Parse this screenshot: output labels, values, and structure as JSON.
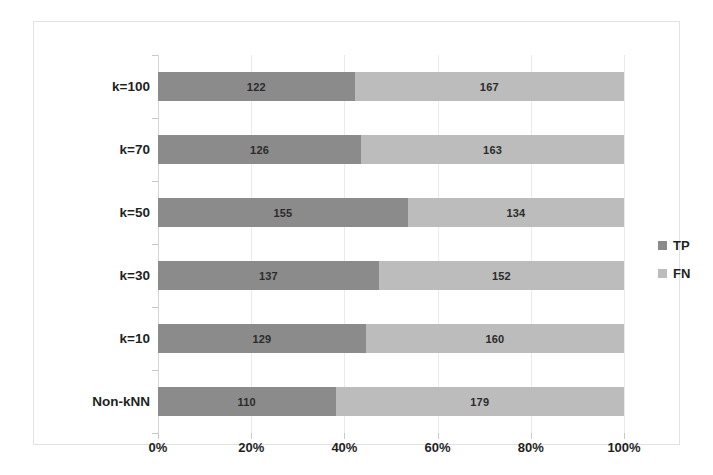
{
  "chart_data": {
    "type": "bar",
    "orientation": "horizontal",
    "stacked": true,
    "normalized": "100%",
    "title": "",
    "xlabel": "",
    "ylabel": "",
    "xlim": [
      0,
      100
    ],
    "grid": true,
    "legend_position": "right",
    "categories": [
      "Non-kNN",
      "k=10",
      "k=30",
      "k=50",
      "k=70",
      "k=100"
    ],
    "series": [
      {
        "name": "TP",
        "color": "#8b8b8b",
        "values": [
          110,
          129,
          137,
          155,
          126,
          122
        ]
      },
      {
        "name": "FN",
        "color": "#bcbcbc",
        "values": [
          179,
          160,
          152,
          134,
          163,
          167
        ]
      }
    ],
    "x_tick_labels": [
      "0%",
      "20%",
      "40%",
      "60%",
      "80%",
      "100%"
    ],
    "x_tick_values": [
      0,
      20,
      40,
      60,
      80,
      100
    ],
    "rows": [
      {
        "category": "k=100",
        "tp": 122,
        "fn": 167,
        "tp_pct": 42.2,
        "fn_pct": 57.8
      },
      {
        "category": "k=70",
        "tp": 126,
        "fn": 163,
        "tp_pct": 43.6,
        "fn_pct": 56.4
      },
      {
        "category": "k=50",
        "tp": 155,
        "fn": 134,
        "tp_pct": 53.6,
        "fn_pct": 46.4
      },
      {
        "category": "k=30",
        "tp": 137,
        "fn": 152,
        "tp_pct": 47.4,
        "fn_pct": 52.6
      },
      {
        "category": "k=10",
        "tp": 129,
        "fn": 160,
        "tp_pct": 44.6,
        "fn_pct": 55.4
      },
      {
        "category": "Non-kNN",
        "tp": 110,
        "fn": 179,
        "tp_pct": 38.1,
        "fn_pct": 61.9
      }
    ]
  },
  "legend": {
    "items": [
      {
        "label": "TP",
        "color": "#8b8b8b"
      },
      {
        "label": "FN",
        "color": "#bcbcbc"
      }
    ]
  }
}
